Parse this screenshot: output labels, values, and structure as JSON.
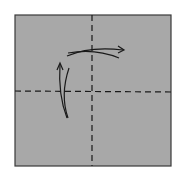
{
  "diagram": {
    "type": "origami-fold-diagram",
    "paper": {
      "color": "#a8a8a8",
      "border": "#3a3a3a",
      "x": 15,
      "y": 15,
      "width": 156,
      "height": 151
    },
    "fold_lines": [
      {
        "kind": "valley-fold",
        "orientation": "vertical",
        "x": 92
      },
      {
        "kind": "valley-fold",
        "orientation": "horizontal",
        "y": 91
      }
    ],
    "arrows": [
      {
        "name": "fold-right-arrow",
        "direction": "right"
      },
      {
        "name": "fold-up-arrow",
        "direction": "up"
      }
    ],
    "line_color": "#1a1a1a"
  }
}
